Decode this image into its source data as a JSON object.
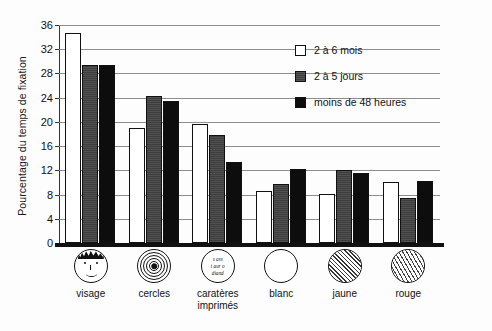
{
  "chart_data": {
    "type": "bar",
    "title": "",
    "xlabel": "",
    "ylabel": "Pourcentage du temps de fixation",
    "ylim": [
      0,
      36
    ],
    "yticks": [
      0,
      4,
      8,
      12,
      16,
      20,
      24,
      28,
      32,
      36
    ],
    "grid": true,
    "legend_position": "top-right",
    "categories": [
      "visage",
      "cercles",
      "caratères imprimés",
      "blanc",
      "jaune",
      "rouge"
    ],
    "category_lines": [
      [
        "visage"
      ],
      [
        "cercles"
      ],
      [
        "caratères",
        "imprimés"
      ],
      [
        "blanc"
      ],
      [
        "jaune"
      ],
      [
        "rouge"
      ]
    ],
    "category_icons": [
      "face-icon",
      "concentric-circles-icon",
      "printed-characters-icon",
      "white-circle-icon",
      "yellow-hatched-circle-icon",
      "red-zigzag-circle-icon"
    ],
    "series": [
      {
        "name": "2 à 6 mois",
        "color": "#ffffff",
        "values": [
          34.7,
          19.0,
          19.6,
          8.6,
          8.1,
          10.0
        ]
      },
      {
        "name": "2 à 5 jours",
        "color": "#3d3d3d",
        "values": [
          29.4,
          24.3,
          17.8,
          9.8,
          12.1,
          7.4
        ]
      },
      {
        "name": "moins de 48 heures",
        "color": "#0d0d0d",
        "values": [
          29.4,
          23.5,
          13.3,
          12.2,
          11.6,
          10.3
        ]
      }
    ]
  },
  "legend": {
    "items": [
      {
        "label": "2 à 6 mois"
      },
      {
        "label": "2 à 5 jours"
      },
      {
        "label": "moins de 48 heures"
      }
    ]
  },
  "icon_text": {
    "printed_characters": [
      "s ass",
      "t aur o",
      "diand"
    ]
  }
}
